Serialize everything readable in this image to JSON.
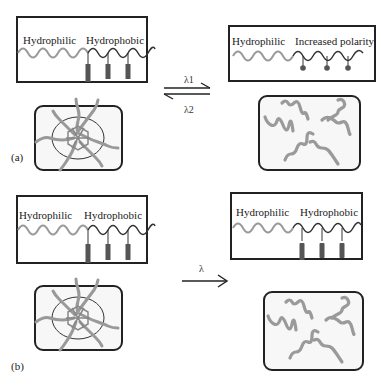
{
  "figure": {
    "panels": [
      {
        "id": "a",
        "label": "(a)",
        "left_polymer": {
          "labels": [
            "Hydrophilic",
            "Hydrophobic"
          ],
          "side_groups": "rectangular hydrophobic pendants",
          "count": 3
        },
        "right_polymer": {
          "labels": [
            "Hydrophilic",
            "Increased polarity"
          ],
          "side_groups": "round polar pendants",
          "count": 3
        },
        "left_state": "micelle",
        "right_state": "dispersed chains",
        "arrow": {
          "type": "reversible",
          "forward_label": "λ1",
          "reverse_label": "λ2"
        }
      },
      {
        "id": "b",
        "label": "(b)",
        "left_polymer": {
          "labels": [
            "Hydrophilic",
            "Hydrophobic"
          ],
          "side_groups": "rectangular hydrophobic pendants",
          "count": 3
        },
        "right_polymer": {
          "labels": [
            "Hydrophilic",
            "Hydrophobic"
          ],
          "side_groups": "rectangular hydrophobic pendants",
          "count": 3
        },
        "left_state": "micelle",
        "right_state": "dispersed chains",
        "arrow": {
          "type": "irreversible",
          "label": "λ"
        }
      }
    ]
  },
  "text": {
    "a_left_hydrophilic": "Hydrophilic",
    "a_left_hydrophobic": "Hydrophobic",
    "a_right_hydrophilic": "Hydrophilic",
    "a_right_polar": "Increased polarity",
    "b_left_hydrophilic": "Hydrophilic",
    "b_left_hydrophobic": "Hydrophobic",
    "b_right_hydrophilic": "Hydrophilic",
    "b_right_hydrophobic": "Hydrophobic",
    "lambda1": "λ1",
    "lambda2": "λ2",
    "lambda": "λ",
    "panel_a": "(a)",
    "panel_b": "(b)"
  },
  "colors": {
    "hydrophilic_chain": "#9a9a9a",
    "hydrophobic_chain": "#333333",
    "pendant": "#555555",
    "border": "#222222"
  }
}
